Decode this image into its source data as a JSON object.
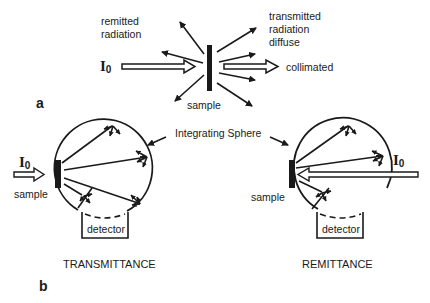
{
  "figure": {
    "panel_a": {
      "label": "a",
      "incident": "I",
      "incident_sub": "0",
      "remitted_line1": "remitted",
      "remitted_line2": "radiation",
      "transmitted_line1": "transmitted",
      "transmitted_line2": "radiation",
      "transmitted_line3": "diffuse",
      "collimated": "collimated",
      "sample": "sample"
    },
    "panel_b": {
      "label": "b",
      "integrating_sphere": "Integrating Sphere",
      "left": {
        "incident": "I",
        "incident_sub": "0",
        "sample": "sample",
        "detector": "detector",
        "title": "TRANSMITTANCE"
      },
      "right": {
        "incident": "I",
        "incident_sub": "0",
        "sample": "sample",
        "detector": "detector",
        "title": "REMITTANCE"
      }
    }
  }
}
